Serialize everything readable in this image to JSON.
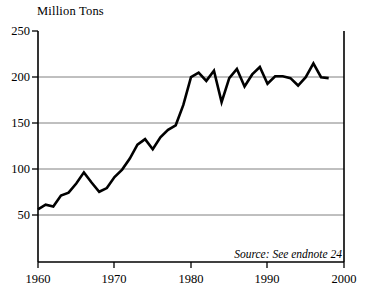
{
  "chart_data": {
    "type": "line",
    "title": "Million Tons",
    "xlabel": "",
    "ylabel": "Million Tons",
    "xlim": [
      1960,
      2000
    ],
    "ylim": [
      0,
      250
    ],
    "grid": true,
    "legend": null,
    "annotations": [
      "Source: See endnote 24"
    ],
    "yticks": [
      50,
      100,
      150,
      200,
      250
    ],
    "ytick_labels": [
      "50",
      "100",
      "150",
      "200",
      "250"
    ],
    "xticks": [
      1960,
      1970,
      1980,
      1990,
      2000
    ],
    "xtick_labels": [
      "1960",
      "1970",
      "1980",
      "1990",
      "2000"
    ],
    "line_color": "#000000",
    "grid_color": "#808080",
    "axis_color": "#000000",
    "x": [
      1960,
      1961,
      1962,
      1963,
      1964,
      1965,
      1966,
      1967,
      1968,
      1969,
      1970,
      1971,
      1972,
      1973,
      1974,
      1975,
      1976,
      1977,
      1978,
      1979,
      1980,
      1981,
      1982,
      1983,
      1984,
      1985,
      1986,
      1987,
      1988,
      1989,
      1990,
      1991,
      1992,
      1993,
      1994,
      1995,
      1996,
      1997,
      1998
    ],
    "values": [
      57,
      62,
      60,
      72,
      75,
      85,
      97,
      86,
      76,
      80,
      92,
      100,
      112,
      127,
      133,
      122,
      135,
      143,
      148,
      170,
      200,
      205,
      196,
      207,
      173,
      199,
      209,
      190,
      203,
      211,
      193,
      201,
      201,
      199,
      191,
      200,
      215,
      200,
      199
    ]
  },
  "source": {
    "note": "Source: See endnote 24"
  }
}
